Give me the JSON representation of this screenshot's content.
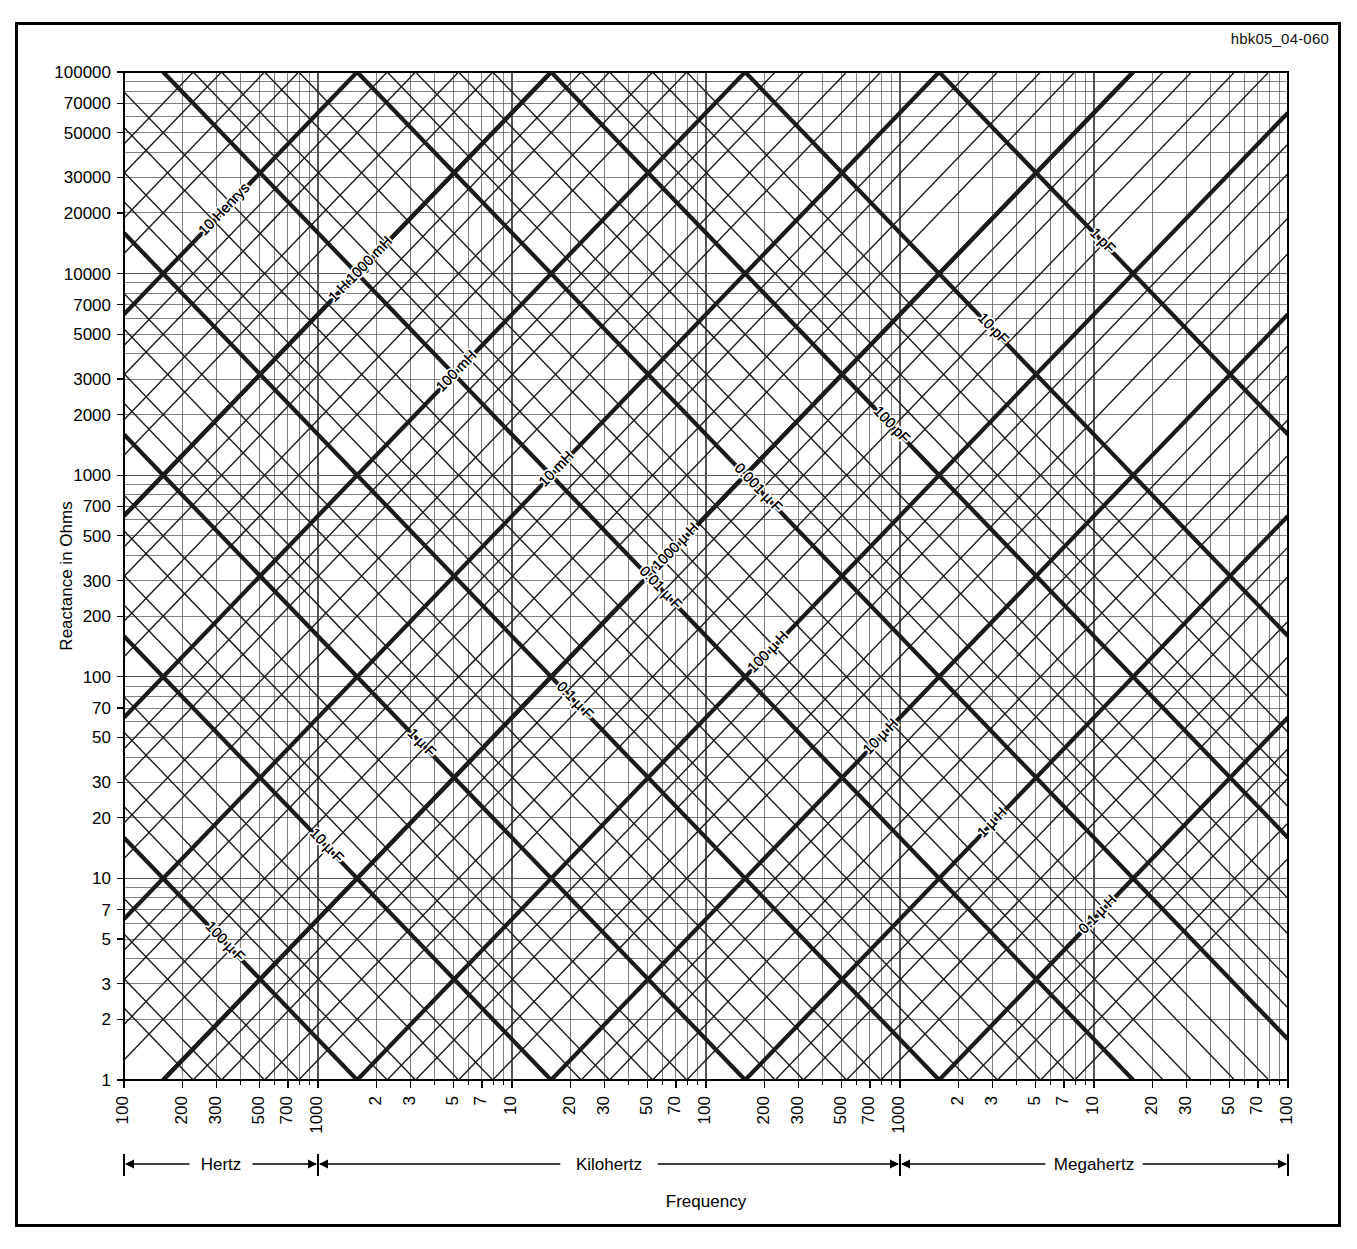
{
  "figure": {
    "id_code": "hbk05_04-060",
    "background": "#ffffff",
    "line_color": "#1a1a1a",
    "grid_color": "#555555",
    "border_color": "#000000"
  },
  "chart_data": {
    "type": "line",
    "title": "",
    "subtitle": "",
    "xlabel": "Frequency",
    "ylabel": "Reactance in Ohms",
    "grid": true,
    "xscale": "log",
    "yscale": "log",
    "xlim": [
      100,
      100000000
    ],
    "ylim": [
      1,
      100000
    ],
    "legend_position": "none",
    "annotations": [
      "hbk05_04-060"
    ],
    "y_ticks": [
      {
        "value": 100000,
        "label": "100000",
        "major": true
      },
      {
        "value": 70000,
        "label": "70000",
        "major": true
      },
      {
        "value": 50000,
        "label": "50000",
        "major": true
      },
      {
        "value": 30000,
        "label": "30000",
        "major": true
      },
      {
        "value": 20000,
        "label": "20000",
        "major": true
      },
      {
        "value": 10000,
        "label": "10000",
        "major": true
      },
      {
        "value": 7000,
        "label": "7000",
        "major": true
      },
      {
        "value": 5000,
        "label": "5000",
        "major": true
      },
      {
        "value": 3000,
        "label": "3000",
        "major": true
      },
      {
        "value": 2000,
        "label": "2000",
        "major": true
      },
      {
        "value": 1000,
        "label": "1000",
        "major": true
      },
      {
        "value": 700,
        "label": "700",
        "major": true
      },
      {
        "value": 500,
        "label": "500",
        "major": true
      },
      {
        "value": 300,
        "label": "300",
        "major": true
      },
      {
        "value": 200,
        "label": "200",
        "major": true
      },
      {
        "value": 100,
        "label": "100",
        "major": true
      },
      {
        "value": 70,
        "label": "70",
        "major": true
      },
      {
        "value": 50,
        "label": "50",
        "major": true
      },
      {
        "value": 30,
        "label": "30",
        "major": true
      },
      {
        "value": 20,
        "label": "20",
        "major": true
      },
      {
        "value": 10,
        "label": "10",
        "major": true
      },
      {
        "value": 7,
        "label": "7",
        "major": true
      },
      {
        "value": 5,
        "label": "5",
        "major": true
      },
      {
        "value": 3,
        "label": "3",
        "major": true
      },
      {
        "value": 2,
        "label": "2",
        "major": true
      },
      {
        "value": 1,
        "label": "1",
        "major": true
      }
    ],
    "x_ticks": [
      {
        "value": 100,
        "label": "100"
      },
      {
        "value": 200,
        "label": "200"
      },
      {
        "value": 300,
        "label": "300"
      },
      {
        "value": 500,
        "label": "500"
      },
      {
        "value": 700,
        "label": "700"
      },
      {
        "value": 1000,
        "label": "1000"
      },
      {
        "value": 2000,
        "label": "2"
      },
      {
        "value": 3000,
        "label": "3"
      },
      {
        "value": 5000,
        "label": "5"
      },
      {
        "value": 7000,
        "label": "7"
      },
      {
        "value": 10000,
        "label": "10"
      },
      {
        "value": 20000,
        "label": "20"
      },
      {
        "value": 30000,
        "label": "30"
      },
      {
        "value": 50000,
        "label": "50"
      },
      {
        "value": 70000,
        "label": "70"
      },
      {
        "value": 100000,
        "label": "100"
      },
      {
        "value": 200000,
        "label": "200"
      },
      {
        "value": 300000,
        "label": "300"
      },
      {
        "value": 500000,
        "label": "500"
      },
      {
        "value": 700000,
        "label": "700"
      },
      {
        "value": 1000000,
        "label": "1000"
      },
      {
        "value": 2000000,
        "label": "2"
      },
      {
        "value": 3000000,
        "label": "3"
      },
      {
        "value": 5000000,
        "label": "5"
      },
      {
        "value": 7000000,
        "label": "7"
      },
      {
        "value": 10000000,
        "label": "10"
      },
      {
        "value": 20000000,
        "label": "20"
      },
      {
        "value": 30000000,
        "label": "30"
      },
      {
        "value": 50000000,
        "label": "50"
      },
      {
        "value": 70000000,
        "label": "70"
      },
      {
        "value": 100000000,
        "label": "100"
      }
    ],
    "frequency_bands": [
      {
        "label": "Hertz",
        "from": 100,
        "to": 1000
      },
      {
        "label": "Kilohertz",
        "from": 1000,
        "to": 1000000
      },
      {
        "label": "Megahertz",
        "from": 1000000,
        "to": 100000000
      }
    ],
    "inductance_series": [
      {
        "label": "10 Henrys",
        "henrys": 10
      },
      {
        "label": "1 Henry",
        "henrys": 1
      },
      {
        "label": "1000 mH",
        "henrys": 1
      },
      {
        "label": "100 mH",
        "henrys": 0.1
      },
      {
        "label": "10 mH",
        "henrys": 0.01
      },
      {
        "label": "1 mH",
        "henrys": 0.001
      },
      {
        "label": "1000 µ H",
        "henrys": 0.001
      },
      {
        "label": "100 µ H",
        "henrys": 0.0001
      },
      {
        "label": "10 µ H",
        "henrys": 1e-05
      },
      {
        "label": "1 µ H",
        "henrys": 1e-06
      },
      {
        "label": "0.1 µ H",
        "henrys": 1e-07
      }
    ],
    "capacitance_series": [
      {
        "label": "100 µ F",
        "farads": 0.0001
      },
      {
        "label": "10 µ F",
        "farads": 1e-05
      },
      {
        "label": "1 µ F",
        "farads": 1e-06
      },
      {
        "label": "0.1 µ F",
        "farads": 1e-07
      },
      {
        "label": "0.01 µ F",
        "farads": 1e-08
      },
      {
        "label": "0.001 µ F",
        "farads": 1e-09
      },
      {
        "label": "100 pF",
        "farads": 1e-10
      },
      {
        "label": "10 pF",
        "farads": 1e-11
      },
      {
        "label": "1 pF",
        "farads": 1e-12
      }
    ]
  }
}
